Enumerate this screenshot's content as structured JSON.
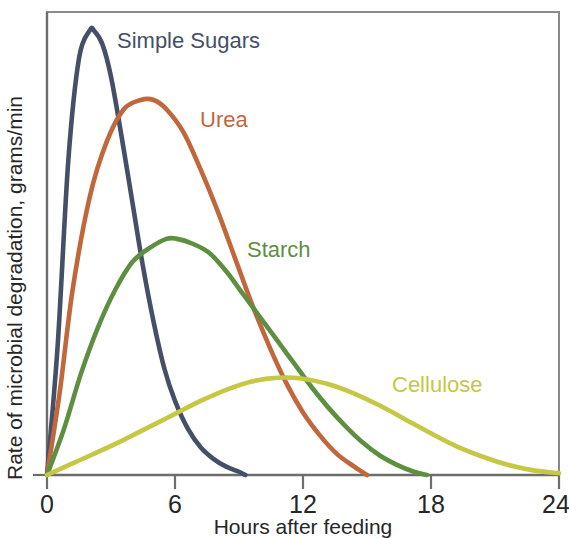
{
  "chart_data": {
    "type": "line",
    "title": "",
    "xlabel": "Hours after feeding",
    "ylabel": "Rate of microbial degradation, grams/min",
    "xlim": [
      0,
      24
    ],
    "ylim": [
      0,
      100
    ],
    "xticks": [
      "0",
      "6",
      "12",
      "18",
      "24"
    ],
    "xtick_values": [
      0,
      6,
      12,
      18,
      24
    ],
    "yticks": [],
    "grid": false,
    "legend_position": "inline-labels",
    "series": [
      {
        "name": "Simple Sugars",
        "color": "#454f67",
        "label_x": 9.3,
        "label_y": 0,
        "peak_hour": 2.2,
        "peak_value": 96,
        "end_hour": 9.3,
        "x": [
          0,
          0.5,
          1.0,
          1.5,
          2.0,
          2.2,
          2.6,
          3.0,
          3.5,
          4.0,
          4.5,
          5.0,
          5.5,
          6.0,
          6.6,
          7.2,
          7.8,
          8.4,
          9.0,
          9.3
        ],
        "y": [
          0,
          28,
          68,
          90,
          96,
          96,
          93,
          86,
          73,
          59,
          45,
          33,
          23,
          16,
          10,
          6,
          3.5,
          1.8,
          0.7,
          0
        ]
      },
      {
        "name": "Urea",
        "color": "#c0673c",
        "peak_hour": 5.0,
        "peak_value": 81,
        "end_hour": 15.0,
        "x": [
          0,
          0.6,
          1.2,
          2.0,
          2.8,
          3.6,
          4.4,
          5.0,
          5.6,
          6.4,
          7.2,
          8.0,
          8.8,
          9.6,
          10.4,
          11.2,
          12.0,
          12.8,
          13.6,
          14.4,
          15.0
        ],
        "y": [
          0,
          18,
          40,
          60,
          72,
          79,
          81,
          81,
          79,
          74,
          66,
          57,
          47,
          37,
          28,
          20,
          13.5,
          8.5,
          4.5,
          1.8,
          0
        ]
      },
      {
        "name": "Starch",
        "color": "#5e8f40",
        "peak_hour": 6.1,
        "peak_value": 51,
        "end_hour": 17.8,
        "x": [
          0,
          0.8,
          1.6,
          2.4,
          3.2,
          4.0,
          4.8,
          5.6,
          6.1,
          6.8,
          7.6,
          8.4,
          9.2,
          10.0,
          10.8,
          11.6,
          12.4,
          13.2,
          14.0,
          14.8,
          15.6,
          16.4,
          17.2,
          17.8
        ],
        "y": [
          0,
          10,
          22,
          32,
          40,
          46,
          49,
          51,
          51,
          50,
          48,
          44,
          39,
          34,
          29,
          24,
          19,
          14.5,
          10.5,
          7,
          4.2,
          2.2,
          0.7,
          0
        ]
      },
      {
        "name": "Cellulose",
        "color": "#c5c845",
        "peak_hour": 10.8,
        "peak_value": 21,
        "end_hour": 24.0,
        "x": [
          0,
          1.2,
          2.4,
          3.6,
          4.8,
          6.0,
          7.2,
          8.4,
          9.6,
          10.8,
          12.0,
          13.2,
          14.4,
          15.6,
          16.8,
          18.0,
          19.2,
          20.4,
          21.6,
          22.8,
          24.0
        ],
        "y": [
          0,
          2.5,
          5,
          7.6,
          10.4,
          13.2,
          16,
          18.4,
          20.2,
          21,
          20.8,
          19.6,
          17.6,
          15,
          12,
          9,
          6.2,
          4,
          2.2,
          1,
          0.4
        ]
      }
    ],
    "annotations": [
      {
        "text": "Simple Sugars",
        "color": "#454f67",
        "x": 117,
        "y": 48
      },
      {
        "text": "Urea",
        "color": "#c0673c",
        "x": 200,
        "y": 127
      },
      {
        "text": "Starch",
        "color": "#5e8f40",
        "x": 247,
        "y": 257
      },
      {
        "text": "Cellulose",
        "color": "#c5c845",
        "x": 392,
        "y": 392
      }
    ]
  },
  "axis": {
    "x_title": "Hours after feeding",
    "y_title": "Rate of microbial degradation, grams/min",
    "x_tick_labels": [
      "0",
      "6",
      "12",
      "18",
      "24"
    ]
  }
}
